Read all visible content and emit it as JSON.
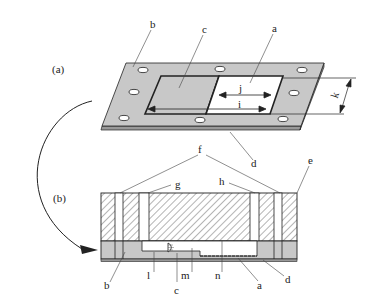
{
  "figure": {
    "panel_a": {
      "panel_label": "(a)",
      "callouts": {
        "b": "b",
        "c": "c",
        "a": "a",
        "j": "j",
        "i": "i",
        "k": "k",
        "d": "d"
      }
    },
    "panel_b": {
      "panel_label": "(b)",
      "callouts": {
        "f": "f",
        "g": "g",
        "h": "h",
        "e": "e",
        "b": "b",
        "l": "l",
        "c": "c",
        "m": "m",
        "n": "n",
        "a": "a",
        "d": "d"
      }
    },
    "colors": {
      "plate_fill": "#c8c8c8",
      "line": "#222222",
      "hatch": "#444444"
    }
  }
}
